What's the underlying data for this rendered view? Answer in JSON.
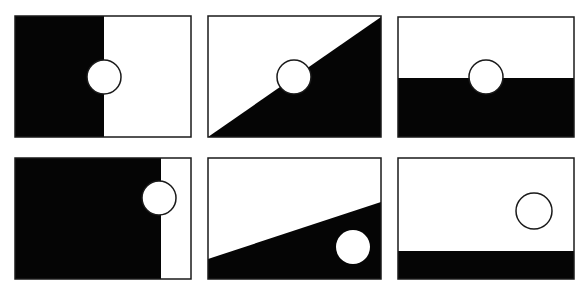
{
  "figure": {
    "width": 587,
    "height": 297,
    "colors": {
      "dark": "#050505",
      "light": "#ffffff",
      "stroke": "#1a1a1a"
    },
    "panels": [
      {
        "id": 1,
        "row": 1,
        "col": 1,
        "frame": [
          15,
          16,
          176,
          121
        ],
        "dark_shape": "left-vertical-half",
        "split": "vertical at x=104",
        "circle": {
          "cx": 104,
          "cy": 77,
          "r": 17,
          "fill": "white",
          "outlined": true
        }
      },
      {
        "id": 2,
        "row": 1,
        "col": 2,
        "frame": [
          208,
          16,
          173,
          121
        ],
        "dark_shape": "lower-right-triangle",
        "split": "diagonal bottom-left to top-right",
        "circle": {
          "cx": 294,
          "cy": 77,
          "r": 17,
          "fill": "white",
          "outlined": true
        }
      },
      {
        "id": 3,
        "row": 1,
        "col": 3,
        "frame": [
          398,
          17,
          176,
          120
        ],
        "dark_shape": "bottom-horizontal-half",
        "split": "horizontal at y=78",
        "circle": {
          "cx": 486,
          "cy": 77,
          "r": 17,
          "fill": "white",
          "outlined": true
        }
      },
      {
        "id": 4,
        "row": 2,
        "col": 1,
        "frame": [
          15,
          158,
          176,
          121
        ],
        "dark_shape": "left-large-block",
        "split": "vertical at x=161",
        "circle": {
          "cx": 159,
          "cy": 198,
          "r": 17,
          "fill": "white",
          "outlined": true
        }
      },
      {
        "id": 5,
        "row": 2,
        "col": 2,
        "frame": [
          208,
          158,
          173,
          121
        ],
        "dark_shape": "bottom-shallow-wedge",
        "split": "slanted line (208,259)-(381,202)",
        "circle": {
          "cx": 353,
          "cy": 247,
          "r": 17,
          "fill": "white",
          "outlined": false
        }
      },
      {
        "id": 6,
        "row": 2,
        "col": 3,
        "frame": [
          398,
          158,
          176,
          121
        ],
        "dark_shape": "bottom-narrow-band",
        "split": "horizontal at y=251",
        "circle": {
          "cx": 534,
          "cy": 211,
          "r": 18,
          "fill": "white",
          "outlined": true
        }
      }
    ]
  }
}
